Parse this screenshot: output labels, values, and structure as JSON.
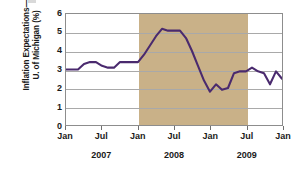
{
  "chart_data": {
    "type": "line",
    "title": "",
    "subtitle": "",
    "xlabel": "",
    "ylabel": "Inflation Expectations—\nU. of Michigan (%)",
    "ylim": [
      0,
      6
    ],
    "yticks": [
      0,
      1,
      2,
      3,
      4,
      5,
      6
    ],
    "ytick_labels": [
      "0",
      "1",
      "2",
      "3",
      "4",
      "5",
      "6"
    ],
    "grid": true,
    "legend": "none",
    "line_color": "#4a2a6e",
    "shading_color": "#c9b188",
    "xtick_labels": [
      "Jan",
      "Jul",
      "Jan",
      "Jul",
      "Jan",
      "Jul",
      "Jan"
    ],
    "year_labels": [
      "2007",
      "2008",
      "2009"
    ],
    "xlim": [
      "2007-01",
      "2010-01"
    ],
    "shaded_regions": [
      {
        "label": "recession",
        "start": "2008-01",
        "end": "2009-07"
      }
    ],
    "series": [
      {
        "name": "Inflation Expectations, U. of Michigan (%)",
        "x": [
          "2007-01",
          "2007-02",
          "2007-03",
          "2007-04",
          "2007-05",
          "2007-06",
          "2007-07",
          "2007-08",
          "2007-09",
          "2007-10",
          "2007-11",
          "2007-12",
          "2008-01",
          "2008-02",
          "2008-03",
          "2008-04",
          "2008-05",
          "2008-06",
          "2008-07",
          "2008-08",
          "2008-09",
          "2008-10",
          "2008-11",
          "2008-12",
          "2009-01",
          "2009-02",
          "2009-03",
          "2009-04",
          "2009-05",
          "2009-06",
          "2009-07",
          "2009-08",
          "2009-09",
          "2009-10",
          "2009-11",
          "2009-12",
          "2010-01"
        ],
        "values": [
          3.0,
          3.0,
          3.0,
          3.3,
          3.4,
          3.4,
          3.2,
          3.1,
          3.1,
          3.4,
          3.4,
          3.4,
          3.4,
          3.8,
          4.3,
          4.8,
          5.2,
          5.1,
          5.1,
          5.1,
          4.7,
          4.0,
          3.2,
          2.4,
          1.8,
          2.2,
          1.9,
          2.0,
          2.8,
          2.9,
          2.9,
          3.1,
          2.9,
          2.8,
          2.2,
          2.9,
          2.5
        ]
      }
    ]
  }
}
